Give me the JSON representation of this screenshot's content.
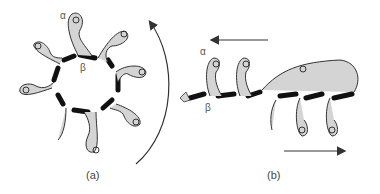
{
  "diagram": {
    "panels": [
      {
        "id": "a",
        "label": "(a)",
        "alpha_label": "α",
        "beta_label": "β",
        "description": "alpha/beta barrel - 8 helix-strand units arranged in a ring",
        "rotation_arrow": "curved-counterclockwise"
      },
      {
        "id": "b",
        "label": "(b)",
        "alpha_label": "α",
        "beta_label": "β",
        "description": "alpha/beta solenoid - helix-strand units in linear arrangement",
        "top_arrow": "left",
        "bottom_arrow": "right"
      }
    ],
    "colors": {
      "helix_fill": "#d4d4d4",
      "helix_stroke": "#333333",
      "strand": "#111111",
      "arrow": "#333333",
      "label": "#555555"
    }
  }
}
